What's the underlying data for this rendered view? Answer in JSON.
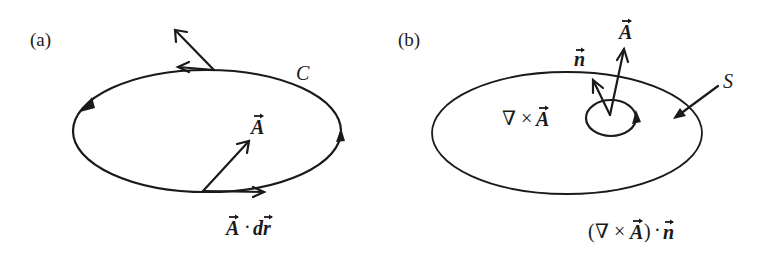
{
  "figure": {
    "background": "#ffffff",
    "ink_color": "#1a1a1a",
    "panels": [
      {
        "id": "a",
        "label": "(a)",
        "curve_label": "C",
        "vector_label": "A",
        "vector_arrow": "→",
        "dot_product_label": {
          "A": "A",
          "dot": "·",
          "dr": "dr"
        }
      },
      {
        "id": "b",
        "label": "(b)",
        "surface_label": "S",
        "curl_label": {
          "nabla": "∇",
          "times": "×",
          "A": "A"
        },
        "normal_label": "n",
        "vector_label": "A",
        "flux_label": {
          "open": "(",
          "nabla": "∇",
          "times": "×",
          "A": "A",
          "close": ")",
          "dot": "·",
          "n": "n"
        }
      }
    ]
  }
}
